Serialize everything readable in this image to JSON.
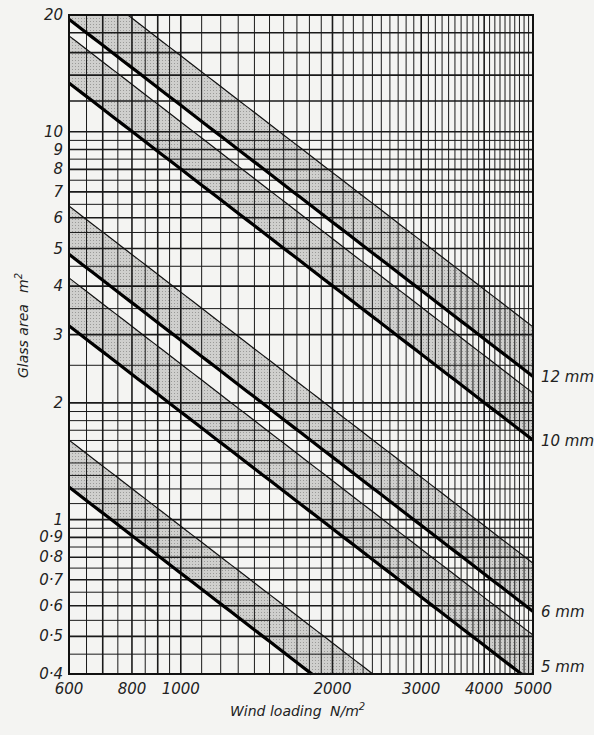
{
  "chart_data": {
    "type": "line",
    "title": "",
    "xlabel": "Wind loading",
    "xunit": "N/m",
    "xunit_sup": "2",
    "ylabel": "Glass area",
    "yunit": "m",
    "yunit_sup": "2",
    "xscale": "log",
    "yscale": "log",
    "xlim": [
      600,
      5000
    ],
    "ylim": [
      0.4,
      20
    ],
    "grid": true,
    "x_ticks": [
      {
        "value": 600,
        "label": "600"
      },
      {
        "value": 800,
        "label": "800"
      },
      {
        "value": 1000,
        "label": "1000"
      },
      {
        "value": 2000,
        "label": "2000"
      },
      {
        "value": 3000,
        "label": "3000"
      },
      {
        "value": 4000,
        "label": "4000"
      },
      {
        "value": 5000,
        "label": "5000"
      }
    ],
    "y_ticks": [
      {
        "value": 20,
        "label": "20"
      },
      {
        "value": 10,
        "label": "10"
      },
      {
        "value": 9,
        "label": "9"
      },
      {
        "value": 8,
        "label": "8"
      },
      {
        "value": 7,
        "label": "7"
      },
      {
        "value": 6,
        "label": "6"
      },
      {
        "value": 5,
        "label": "5"
      },
      {
        "value": 4,
        "label": "4"
      },
      {
        "value": 3,
        "label": "3"
      },
      {
        "value": 2,
        "label": "2"
      },
      {
        "value": 1,
        "label": "1"
      },
      {
        "value": 0.9,
        "label": "0·9"
      },
      {
        "value": 0.8,
        "label": "0·8"
      },
      {
        "value": 0.7,
        "label": "0·7"
      },
      {
        "value": 0.6,
        "label": "0·6"
      },
      {
        "value": 0.5,
        "label": "0·5"
      },
      {
        "value": 0.4,
        "label": "0·4"
      }
    ],
    "note": "Each line follows area × load = constant (slope −1 on log-log). Shaded bands lie between each thick (lower) line and its thin (upper) boundary.",
    "series": [
      {
        "name": "12 mm",
        "label": "12mm",
        "lower_const": 11700,
        "upper_const": 15700,
        "lower_line": {
          "x": [
            600,
            5000
          ],
          "y": [
            19.5,
            2.34
          ]
        },
        "upper_line": {
          "x": [
            785,
            5000
          ],
          "y": [
            20,
            3.14
          ]
        }
      },
      {
        "name": "10 mm",
        "label": "10mm",
        "lower_const": 8016,
        "upper_const": 10600,
        "lower_line": {
          "x": [
            600,
            5000
          ],
          "y": [
            13.36,
            1.6
          ]
        },
        "upper_line": {
          "x": [
            600,
            5000
          ],
          "y": [
            17.7,
            2.12
          ]
        }
      },
      {
        "name": "6 mm",
        "label": "6mm",
        "lower_const": 2900,
        "upper_const": 3860,
        "lower_line": {
          "x": [
            600,
            5000
          ],
          "y": [
            4.84,
            0.58
          ]
        },
        "upper_line": {
          "x": [
            600,
            5000
          ],
          "y": [
            6.43,
            0.77
          ]
        }
      },
      {
        "name": "5 mm",
        "label": "5mm",
        "lower_const": 1896,
        "upper_const": 2520,
        "lower_line": {
          "x": [
            600,
            4740
          ],
          "y": [
            3.16,
            0.4
          ]
        },
        "upper_line": {
          "x": [
            600,
            5000
          ],
          "y": [
            4.2,
            0.5
          ]
        }
      },
      {
        "name": "unlabeled (thinnest)",
        "label": "",
        "lower_const": 728,
        "upper_const": 962,
        "lower_line": {
          "x": [
            600,
            1820
          ],
          "y": [
            1.21,
            0.4
          ]
        },
        "upper_line": {
          "x": [
            600,
            2405
          ],
          "y": [
            1.6,
            0.4
          ]
        }
      }
    ],
    "series_labels_at_right": [
      {
        "text": "12mm",
        "value": 2.34
      },
      {
        "text": "10mm",
        "value": 1.6
      },
      {
        "text": "6mm",
        "value": 0.58
      },
      {
        "text": "5mm",
        "value": 0.4
      }
    ]
  }
}
